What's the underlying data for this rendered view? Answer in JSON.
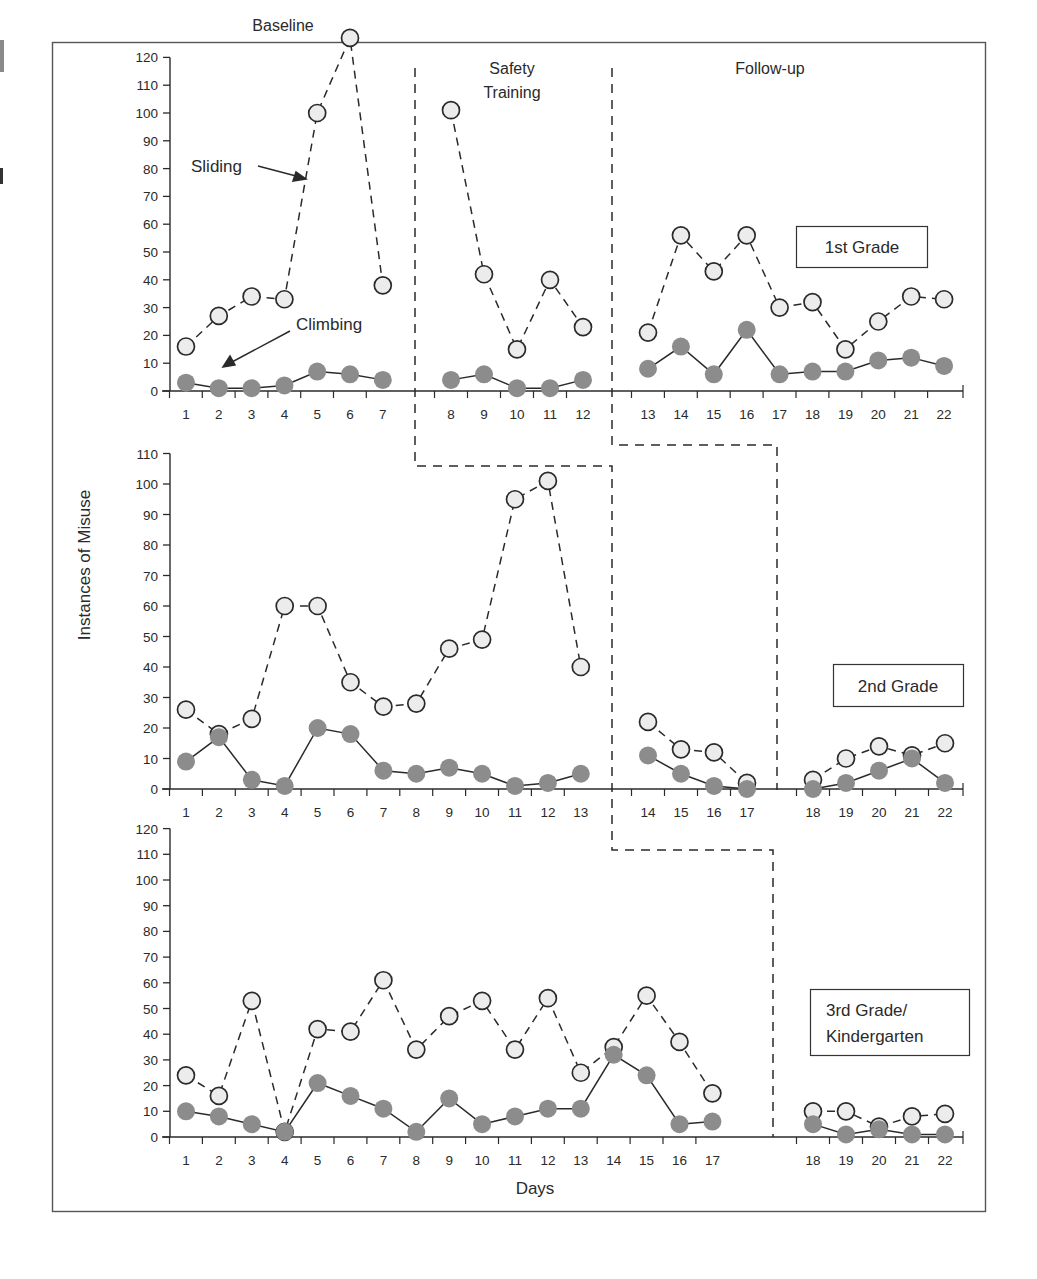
{
  "chart_data": {
    "type": "line",
    "title": "",
    "xlabel": "Days",
    "ylabel": "Instances of Misuse",
    "phases": [
      "Baseline",
      "Safety Training",
      "Follow-up"
    ],
    "legend_annotations": [
      {
        "label": "Sliding",
        "marker": "open circle, dashed line"
      },
      {
        "label": "Climbing",
        "marker": "filled gray circle, solid line"
      }
    ],
    "grid": false,
    "panels": [
      {
        "name": "1st Grade",
        "ylim": [
          0,
          120
        ],
        "yticks": [
          0,
          10,
          20,
          30,
          40,
          50,
          60,
          70,
          80,
          90,
          100,
          110,
          120
        ],
        "phase_days": {
          "baseline": [
            1,
            7
          ],
          "safety_training": [
            8,
            12
          ],
          "follow_up": [
            13,
            22
          ]
        },
        "series": [
          {
            "name": "Sliding",
            "segments": [
              {
                "x": [
                  1,
                  2,
                  3,
                  4,
                  5,
                  6,
                  7
                ],
                "y": [
                  16,
                  27,
                  34,
                  33,
                  100,
                  127,
                  38
                ]
              },
              {
                "x": [
                  8,
                  9,
                  10,
                  11,
                  12
                ],
                "y": [
                  101,
                  42,
                  15,
                  40,
                  23
                ]
              },
              {
                "x": [
                  13,
                  14,
                  15,
                  16,
                  17,
                  18,
                  19,
                  20,
                  21,
                  22
                ],
                "y": [
                  21,
                  56,
                  43,
                  56,
                  30,
                  32,
                  15,
                  25,
                  34,
                  33
                ]
              }
            ]
          },
          {
            "name": "Climbing",
            "segments": [
              {
                "x": [
                  1,
                  2,
                  3,
                  4,
                  5,
                  6,
                  7
                ],
                "y": [
                  3,
                  1,
                  1,
                  2,
                  7,
                  6,
                  4
                ]
              },
              {
                "x": [
                  8,
                  9,
                  10,
                  11,
                  12
                ],
                "y": [
                  4,
                  6,
                  1,
                  1,
                  4
                ]
              },
              {
                "x": [
                  13,
                  14,
                  15,
                  16,
                  17,
                  18,
                  19,
                  20,
                  21,
                  22
                ],
                "y": [
                  8,
                  16,
                  6,
                  22,
                  6,
                  7,
                  7,
                  11,
                  12,
                  9
                ]
              }
            ]
          }
        ]
      },
      {
        "name": "2nd Grade",
        "ylim": [
          0,
          110
        ],
        "yticks": [
          0,
          10,
          20,
          30,
          40,
          50,
          60,
          70,
          80,
          90,
          100,
          110
        ],
        "phase_days": {
          "baseline": [
            1,
            13
          ],
          "safety_training": [
            14,
            17
          ],
          "follow_up": [
            18,
            22
          ]
        },
        "series": [
          {
            "name": "Sliding",
            "segments": [
              {
                "x": [
                  1,
                  2,
                  3,
                  4,
                  5,
                  6,
                  7,
                  8,
                  9,
                  10,
                  11,
                  12,
                  13
                ],
                "y": [
                  26,
                  18,
                  23,
                  60,
                  60,
                  35,
                  27,
                  28,
                  46,
                  49,
                  95,
                  101,
                  40
                ]
              },
              {
                "x": [
                  14,
                  15,
                  16,
                  17
                ],
                "y": [
                  22,
                  13,
                  12,
                  2
                ]
              },
              {
                "x": [
                  18,
                  19,
                  20,
                  21,
                  22
                ],
                "y": [
                  3,
                  10,
                  14,
                  11,
                  15
                ]
              }
            ]
          },
          {
            "name": "Climbing",
            "segments": [
              {
                "x": [
                  1,
                  2,
                  3,
                  4,
                  5,
                  6,
                  7,
                  8,
                  9,
                  10,
                  11,
                  12,
                  13
                ],
                "y": [
                  9,
                  17,
                  3,
                  1,
                  20,
                  18,
                  6,
                  5,
                  7,
                  5,
                  1,
                  2,
                  5
                ]
              },
              {
                "x": [
                  14,
                  15,
                  16,
                  17
                ],
                "y": [
                  11,
                  5,
                  1,
                  0
                ]
              },
              {
                "x": [
                  18,
                  19,
                  20,
                  21,
                  22
                ],
                "y": [
                  0,
                  2,
                  6,
                  10,
                  2
                ]
              }
            ]
          }
        ]
      },
      {
        "name": "3rd Grade/ Kindergarten",
        "ylim": [
          0,
          120
        ],
        "yticks": [
          0,
          10,
          20,
          30,
          40,
          50,
          60,
          70,
          80,
          90,
          100,
          110,
          120
        ],
        "phase_days": {
          "baseline": [
            1,
            17
          ],
          "safety_training": [
            18,
            22
          ]
        },
        "series": [
          {
            "name": "Sliding",
            "segments": [
              {
                "x": [
                  1,
                  2,
                  3,
                  4,
                  5,
                  6,
                  7,
                  8,
                  9,
                  10,
                  11,
                  12,
                  13,
                  14,
                  15,
                  16,
                  17
                ],
                "y": [
                  24,
                  16,
                  53,
                  2,
                  42,
                  41,
                  61,
                  34,
                  47,
                  53,
                  34,
                  54,
                  25,
                  35,
                  55,
                  37,
                  17
                ]
              },
              {
                "x": [
                  18,
                  19,
                  20,
                  21,
                  22
                ],
                "y": [
                  10,
                  10,
                  4,
                  8,
                  9
                ]
              }
            ]
          },
          {
            "name": "Climbing",
            "segments": [
              {
                "x": [
                  1,
                  2,
                  3,
                  4,
                  5,
                  6,
                  7,
                  8,
                  9,
                  10,
                  11,
                  12,
                  13,
                  14,
                  15,
                  16,
                  17
                ],
                "y": [
                  10,
                  8,
                  5,
                  2,
                  21,
                  16,
                  11,
                  2,
                  15,
                  5,
                  8,
                  11,
                  11,
                  32,
                  24,
                  5,
                  6
                ]
              },
              {
                "x": [
                  18,
                  19,
                  20,
                  21,
                  22
                ],
                "y": [
                  5,
                  1,
                  3,
                  1,
                  1
                ]
              }
            ]
          }
        ]
      }
    ]
  },
  "labels": {
    "phase_baseline": "Baseline",
    "phase_safety_line1": "Safety",
    "phase_safety_line2": "Training",
    "phase_followup": "Follow-up",
    "annotation_sliding": "Sliding",
    "annotation_climbing": "Climbing",
    "panel1_label": "1st Grade",
    "panel2_label": "2nd Grade",
    "panel3_label_line1": "3rd Grade/",
    "panel3_label_line2": "Kindergarten",
    "y_axis_title": "Instances of Misuse",
    "x_axis_title": "Days"
  },
  "colors": {
    "ink": "#2a2a2a",
    "sliding_fill": "#ececec",
    "climbing_fill": "#8c8c8c",
    "frame": "#555555"
  }
}
